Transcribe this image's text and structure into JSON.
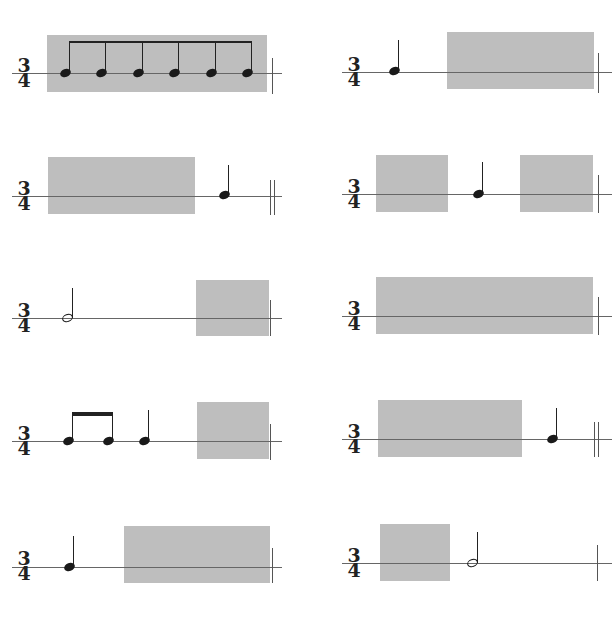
{
  "header": {
    "partial_instruction_text": ""
  },
  "time_signature": {
    "top": "3",
    "bottom": "4"
  },
  "exercises": [
    {
      "id": 1,
      "column": "left",
      "row": 1,
      "notes": [
        "eighth",
        "eighth",
        "eighth",
        "eighth",
        "eighth",
        "eighth"
      ],
      "beamed": true,
      "shaded_regions": 1
    },
    {
      "id": 2,
      "column": "right",
      "row": 1,
      "notes": [
        "quarter"
      ],
      "shaded_regions": 1
    },
    {
      "id": 3,
      "column": "left",
      "row": 2,
      "notes": [
        "quarter"
      ],
      "shaded_regions": 1
    },
    {
      "id": 4,
      "column": "right",
      "row": 2,
      "notes": [
        "quarter"
      ],
      "shaded_regions": 2
    },
    {
      "id": 5,
      "column": "left",
      "row": 3,
      "notes": [
        "half"
      ],
      "shaded_regions": 1
    },
    {
      "id": 6,
      "column": "right",
      "row": 3,
      "notes": [],
      "shaded_regions": 1
    },
    {
      "id": 7,
      "column": "left",
      "row": 4,
      "notes": [
        "eighth",
        "eighth",
        "quarter"
      ],
      "shaded_regions": 1
    },
    {
      "id": 8,
      "column": "right",
      "row": 4,
      "notes": [
        "quarter"
      ],
      "shaded_regions": 1
    },
    {
      "id": 9,
      "column": "left",
      "row": 5,
      "notes": [
        "quarter"
      ],
      "shaded_regions": 1
    },
    {
      "id": 10,
      "column": "right",
      "row": 5,
      "notes": [
        "half"
      ],
      "shaded_regions": 1
    }
  ],
  "colors": {
    "shade": "#b8b8b8",
    "ink": "#1a1a1a",
    "staff_line": "#666666"
  }
}
